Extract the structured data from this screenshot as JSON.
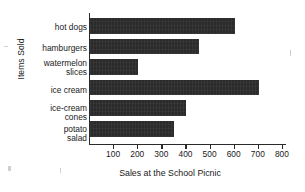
{
  "chart_data": {
    "type": "bar",
    "orientation": "horizontal",
    "title": "",
    "xlabel": "Sales at the School Picnic",
    "ylabel": "Items Sold",
    "categories": [
      "hot dogs",
      "hamburgers",
      "watermelon slices",
      "ice cream",
      "ice-cream cones",
      "potato salad"
    ],
    "category_lines": [
      [
        "hot dogs"
      ],
      [
        "hamburgers"
      ],
      [
        "watermelon",
        "slices"
      ],
      [
        "ice cream"
      ],
      [
        "ice-cream",
        "cones"
      ],
      [
        "potato",
        "salad"
      ]
    ],
    "values": [
      600,
      450,
      200,
      700,
      400,
      350
    ],
    "xlim": [
      0,
      850
    ],
    "xticks": [
      100,
      200,
      300,
      400,
      500,
      600,
      700,
      800
    ],
    "xtick_labels": [
      "100",
      "200",
      "300",
      "400",
      "500",
      "600",
      "700",
      "800"
    ],
    "grid": false,
    "legend": null,
    "bar_color": "#2b2b2b",
    "axis_color": "#2b2b2b",
    "background_color": "#ffffff"
  }
}
